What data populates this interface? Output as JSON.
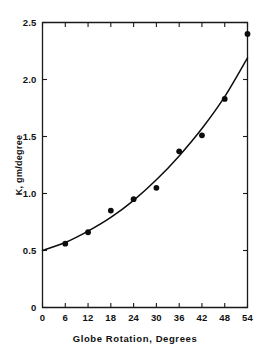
{
  "chart_data": {
    "type": "scatter",
    "title": "",
    "xlabel": "Globe Rotation, Degrees",
    "ylabel": "K, gm/degree",
    "xlim": [
      0,
      54
    ],
    "ylim": [
      0,
      2.5
    ],
    "grid": false,
    "legend": null,
    "xticks": [
      0,
      6,
      12,
      18,
      24,
      30,
      36,
      42,
      48,
      54
    ],
    "xtick_labels": [
      "0",
      "6",
      "12",
      "18",
      "24",
      "30",
      "36",
      "42",
      "48",
      "54"
    ],
    "yticks": [
      0,
      0.5,
      1.0,
      1.5,
      2.0,
      2.5
    ],
    "ytick_labels": [
      "0",
      "0.5",
      "1.0",
      "1.5",
      "2.0",
      "2.5"
    ],
    "series": [
      {
        "name": "measured",
        "marker": "filled-circle",
        "x": [
          6,
          12,
          18,
          24,
          30,
          36,
          42,
          48,
          54
        ],
        "values": [
          0.56,
          0.66,
          0.85,
          0.95,
          1.05,
          1.37,
          1.51,
          1.83,
          2.4
        ]
      },
      {
        "name": "fitted-curve",
        "marker": "none",
        "x": [
          0,
          6,
          12,
          18,
          24,
          30,
          36,
          42,
          48,
          54
        ],
        "values": [
          0.5,
          0.57,
          0.67,
          0.79,
          0.94,
          1.12,
          1.33,
          1.57,
          1.85,
          2.19
        ]
      }
    ]
  },
  "axes": {
    "y_title": "K, gm/degree",
    "x_title": "Globe Rotation, Degrees"
  }
}
